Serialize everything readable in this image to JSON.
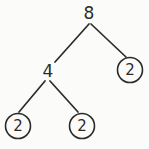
{
  "diagram": {
    "type": "factor-tree",
    "background_color": "#fbfbfa",
    "stroke_color": "#2b2b2b",
    "nodes": [
      {
        "id": "root",
        "label": "8",
        "circled": false,
        "cx": 89,
        "cy": 13,
        "r": 0
      },
      {
        "id": "branch-4",
        "label": "4",
        "circled": false,
        "cx": 48,
        "cy": 71,
        "r": 0
      },
      {
        "id": "prime-right",
        "label": "2",
        "circled": true,
        "cx": 130,
        "cy": 70,
        "r": 12.5
      },
      {
        "id": "prime-left",
        "label": "2",
        "circled": true,
        "cx": 18,
        "cy": 126,
        "r": 12.5
      },
      {
        "id": "prime-middle",
        "label": "2",
        "circled": true,
        "cx": 82,
        "cy": 126,
        "r": 12.5
      }
    ],
    "edges": [
      {
        "id": "edge-root-to-4",
        "x1": 89,
        "y1": 24,
        "x2": 55,
        "y2": 62
      },
      {
        "id": "edge-root-to-prime",
        "x1": 91,
        "y1": 24,
        "x2": 126,
        "y2": 57
      },
      {
        "id": "edge-4-to-prime-left",
        "x1": 45,
        "y1": 81,
        "x2": 19,
        "y2": 112
      },
      {
        "id": "edge-4-to-prime-middle",
        "x1": 50,
        "y1": 81,
        "x2": 78,
        "y2": 112
      }
    ]
  }
}
